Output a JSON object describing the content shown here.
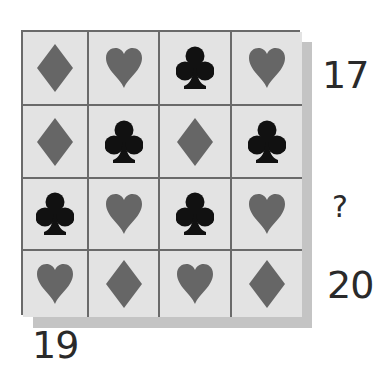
{
  "puzzle": {
    "colors": {
      "cell_background": "#e3e3e3",
      "grid_line": "#6a6a6a",
      "shadow": "#c4c4c4",
      "gray_suit": "#666666",
      "black_suit": "#111111",
      "label_text": "#2a2a2a"
    },
    "grid": [
      [
        "diamond",
        "heart",
        "club",
        "heart"
      ],
      [
        "diamond",
        "club",
        "diamond",
        "club"
      ],
      [
        "club",
        "heart",
        "club",
        "heart"
      ],
      [
        "heart",
        "diamond",
        "heart",
        "diamond"
      ]
    ],
    "row_totals": [
      "17",
      "",
      "?",
      "20"
    ],
    "column_totals": [
      "19",
      "",
      "",
      ""
    ]
  }
}
